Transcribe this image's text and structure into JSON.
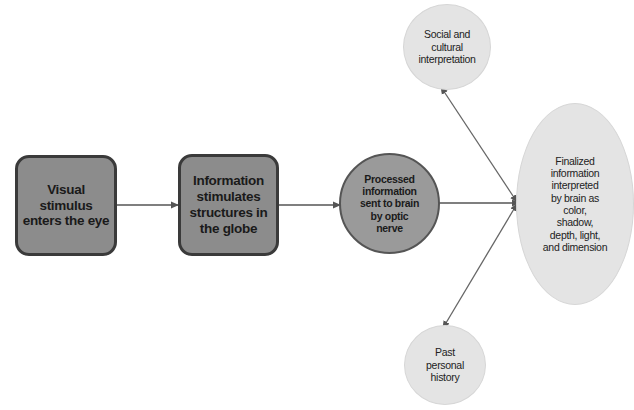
{
  "diagram": {
    "type": "flowchart",
    "colors": {
      "background": "#ffffff",
      "box_fill": "#8c8c8c",
      "box_border": "#3a3a3a",
      "process_circle_fill": "#9a9a9a",
      "process_circle_border": "#555555",
      "outcome_fill": "#e4e4e4",
      "arrow": "#555555"
    },
    "nodes": [
      {
        "id": "n1",
        "shape": "rounded-rect",
        "label": "Visual stimulus enters the eye"
      },
      {
        "id": "n2",
        "shape": "rounded-rect",
        "label": "Information stimulates structures in the globe"
      },
      {
        "id": "n3",
        "shape": "circle",
        "label": "Processed information sent to brain by optic nerve"
      },
      {
        "id": "n4",
        "shape": "ellipse",
        "label": "Finalized information interpreted by brain as color, shadow, depth, light, and dimension"
      },
      {
        "id": "n5",
        "shape": "circle",
        "label": "Social and cultural interpretation"
      },
      {
        "id": "n6",
        "shape": "circle",
        "label": "Past personal history"
      }
    ],
    "edges": [
      {
        "from": "n1",
        "to": "n2",
        "direction": "forward"
      },
      {
        "from": "n2",
        "to": "n3",
        "direction": "forward"
      },
      {
        "from": "n3",
        "to": "n4",
        "direction": "forward"
      },
      {
        "from": "n5",
        "to": "n4",
        "direction": "bidirectional"
      },
      {
        "from": "n6",
        "to": "n4",
        "direction": "bidirectional"
      }
    ]
  },
  "labels": {
    "n1": [
      "Visual",
      "stimulus",
      "enters the eye"
    ],
    "n2": [
      "Information",
      "stimulates",
      "structures in",
      "the globe"
    ],
    "n3": [
      "Processed",
      "information",
      "sent to brain",
      "by optic",
      "nerve"
    ],
    "n4": [
      "Finalized",
      "information",
      "interpreted",
      "by brain as",
      "color,",
      "shadow,",
      "depth, light,",
      "and dimension"
    ],
    "n5": [
      "Social and",
      "cultural",
      "interpretation"
    ],
    "n6": [
      "Past",
      "personal",
      "history"
    ]
  }
}
